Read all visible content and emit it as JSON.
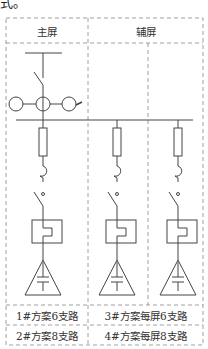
{
  "caption_fragment": "式。",
  "header": {
    "main_screen": "主屏",
    "aux_screen": "辅屏"
  },
  "footer": {
    "row1_left": "1#方案6支路",
    "row1_right": "3#方案每屏6支路",
    "row2_left": "2#方案8支路",
    "row2_right": "4#方案每屏8支路"
  },
  "components": {
    "incoming": [
      "busbar-top",
      "isolating-switch",
      "current-transformers"
    ],
    "branch": [
      "fuse",
      "hook-disconnect",
      "switch",
      "thermal-relay",
      "capacitor-triangle"
    ],
    "branch_count": 3
  },
  "colors": {
    "line": "#444444",
    "dash": "#888888"
  }
}
